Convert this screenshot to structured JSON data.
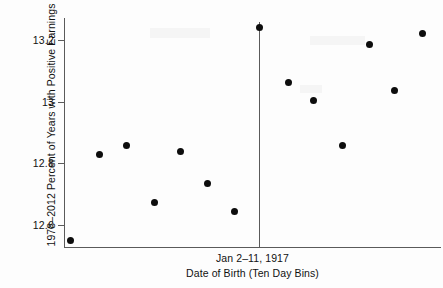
{
  "chart_data": {
    "type": "scatter",
    "title": "",
    "xlabel": "Date of Birth (Ten Day Bins)",
    "ylabel": "1978–2012 Percent of Years with Positive Earnings",
    "annotation": "Jan 2–11, 1917",
    "grid": false,
    "legend": null,
    "ylim": [
      12.49,
      13.275
    ],
    "yticks": [
      12.6,
      12.8,
      13,
      13.2
    ],
    "ytick_labels": [
      "12.6",
      "12.8",
      "13",
      "13.2"
    ],
    "xlim": [
      0,
      15
    ],
    "xticks": [],
    "xtick_labels": [],
    "cutoff_x": 7.5,
    "cutoff_label": "Jan 2–11, 1917",
    "point_color": "#0d0d0d",
    "axis_color": "#5a5a5a",
    "x": [
      0.45,
      1.34,
      2.25,
      3.15,
      4.04,
      4.95,
      5.85,
      6.78,
      7.75,
      8.65,
      9.55,
      10.45,
      11.35,
      12.35
    ],
    "values": [
      12.55,
      12.83,
      12.86,
      12.67,
      12.84,
      12.74,
      12.65,
      13.24,
      13.06,
      13.0,
      12.86,
      13.19,
      13.04,
      13.22
    ],
    "points": [
      {
        "x": 0.45,
        "y": 12.55,
        "px": 70,
        "py": 240
      },
      {
        "x": 1.34,
        "y": 12.83,
        "px": 99,
        "py": 154
      },
      {
        "x": 2.25,
        "y": 12.86,
        "px": 126,
        "py": 145
      },
      {
        "x": 3.15,
        "y": 12.67,
        "px": 154,
        "py": 202
      },
      {
        "x": 4.04,
        "y": 12.84,
        "px": 180,
        "py": 151
      },
      {
        "x": 4.95,
        "y": 12.74,
        "px": 207,
        "py": 183
      },
      {
        "x": 5.85,
        "y": 12.65,
        "px": 234,
        "py": 211
      },
      {
        "x": 6.78,
        "y": 13.24,
        "px": 259,
        "py": 27
      },
      {
        "x": 7.75,
        "y": 13.06,
        "px": 288,
        "py": 82
      },
      {
        "x": 8.65,
        "y": 13.0,
        "px": 313,
        "py": 100
      },
      {
        "x": 9.55,
        "y": 12.86,
        "px": 342,
        "py": 145
      },
      {
        "x": 10.45,
        "y": 13.19,
        "px": 369,
        "py": 44
      },
      {
        "x": 11.35,
        "y": 13.04,
        "px": 394,
        "py": 90
      },
      {
        "x": 12.35,
        "y": 13.22,
        "px": 422,
        "py": 33
      }
    ],
    "ytick_px": [
      225,
      163,
      102,
      40
    ]
  }
}
